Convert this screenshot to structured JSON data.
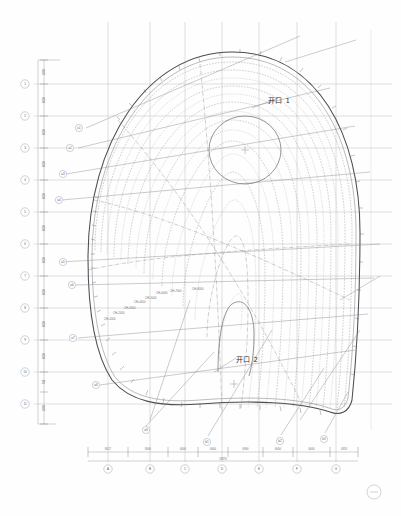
{
  "drawing": {
    "title": "屋面壳体平面图",
    "type": "architectural-shell-roof-plan",
    "sheet_marker": "page-marker-circle",
    "background_color": "#fefefe",
    "line_color": "#4c4c52",
    "grid_color": "#b9b9bd",
    "contour_color": "#8e8e96"
  },
  "openings": [
    {
      "id": "opening-1",
      "label": "开口 1",
      "label_x": 268,
      "label_y": 101,
      "cx": 245,
      "cy": 150,
      "rx": 36,
      "ry": 34,
      "center_mark": true
    },
    {
      "id": "opening-2",
      "label": "开口 2",
      "label_y": 360,
      "label_x": 236,
      "label_x2": 236
    }
  ],
  "contour_labels": [
    {
      "text": "CH+1000",
      "x": 104,
      "y": 320
    },
    {
      "text": "CH+2000",
      "x": 113,
      "y": 314
    },
    {
      "text": "CH+3000",
      "x": 124,
      "y": 309
    },
    {
      "text": "CH+4000",
      "x": 134,
      "y": 303
    },
    {
      "text": "CH+5000",
      "x": 145,
      "y": 299
    },
    {
      "text": "CH+6000",
      "x": 156,
      "y": 294
    },
    {
      "text": "CH+7000",
      "x": 170,
      "y": 292
    },
    {
      "text": "CH+8000",
      "x": 192,
      "y": 290
    }
  ],
  "dimensions": {
    "bottom": {
      "total_label": "53870",
      "segments": [
        {
          "label": "8017",
          "x1": 88,
          "x2": 128
        },
        {
          "label": "8000",
          "x1": 128,
          "x2": 168
        },
        {
          "label": "6000",
          "x1": 168,
          "x2": 198
        },
        {
          "label": "6000",
          "x1": 198,
          "x2": 228
        },
        {
          "label": "6990",
          "x1": 228,
          "x2": 263
        },
        {
          "label": "6000",
          "x1": 263,
          "x2": 293
        },
        {
          "label": "6000",
          "x1": 293,
          "x2": 330
        },
        {
          "label": "4953",
          "x1": 330,
          "x2": 358
        }
      ]
    },
    "left": {
      "segments": [
        {
          "label": "5000",
          "y1": 60,
          "y2": 84
        },
        {
          "label": "6000",
          "y1": 84,
          "y2": 116
        },
        {
          "label": "6000",
          "y1": 116,
          "y2": 148
        },
        {
          "label": "6000",
          "y1": 148,
          "y2": 180
        },
        {
          "label": "6000",
          "y1": 180,
          "y2": 212
        },
        {
          "label": "6000",
          "y1": 212,
          "y2": 244
        },
        {
          "label": "6000",
          "y1": 244,
          "y2": 276
        },
        {
          "label": "6000",
          "y1": 276,
          "y2": 308
        },
        {
          "label": "6000",
          "y1": 308,
          "y2": 340
        },
        {
          "label": "6000",
          "y1": 340,
          "y2": 372
        },
        {
          "label": "700",
          "y1": 372,
          "y2": 392
        },
        {
          "label": "5000",
          "y1": 392,
          "y2": 424
        }
      ]
    }
  },
  "grid_bubbles": {
    "bottom": [
      {
        "label": "A",
        "x": 108,
        "y": 469
      },
      {
        "label": "B",
        "x": 150,
        "y": 469
      },
      {
        "label": "C",
        "x": 185,
        "y": 469
      },
      {
        "label": "D",
        "x": 222,
        "y": 469
      },
      {
        "label": "E",
        "x": 259,
        "y": 469
      },
      {
        "label": "F",
        "x": 297,
        "y": 469
      },
      {
        "label": "G",
        "x": 336,
        "y": 469
      }
    ],
    "left": [
      {
        "label": "1",
        "x": 25,
        "y": 84
      },
      {
        "label": "2",
        "x": 25,
        "y": 116
      },
      {
        "label": "3",
        "x": 25,
        "y": 148
      },
      {
        "label": "4",
        "x": 25,
        "y": 180
      },
      {
        "label": "5",
        "x": 25,
        "y": 212
      },
      {
        "label": "6",
        "x": 25,
        "y": 244
      },
      {
        "label": "7",
        "x": 25,
        "y": 276
      },
      {
        "label": "8",
        "x": 25,
        "y": 308
      },
      {
        "label": "9",
        "x": 25,
        "y": 340
      },
      {
        "label": "10",
        "x": 25,
        "y": 372
      },
      {
        "label": "11",
        "x": 25,
        "y": 404
      }
    ]
  },
  "callout_bubbles": [
    {
      "label": "a1",
      "x": 79,
      "y": 128,
      "tx": 175,
      "ty": 110
    },
    {
      "label": "a2",
      "x": 70,
      "y": 148,
      "tx": 160,
      "ty": 132
    },
    {
      "label": "a3",
      "x": 63,
      "y": 174,
      "tx": 150,
      "ty": 160
    },
    {
      "label": "a4",
      "x": 59,
      "y": 200,
      "tx": 146,
      "ty": 188
    },
    {
      "label": "a5",
      "x": 63,
      "y": 262,
      "tx": 150,
      "ty": 252
    },
    {
      "label": "a6",
      "x": 72,
      "y": 285,
      "tx": 160,
      "ty": 276
    },
    {
      "label": "a7",
      "x": 73,
      "y": 338,
      "tx": 162,
      "ty": 330
    },
    {
      "label": "a8",
      "x": 96,
      "y": 385,
      "tx": 178,
      "ty": 372
    },
    {
      "label": "a9",
      "x": 146,
      "y": 430,
      "tx": 206,
      "ty": 392
    },
    {
      "label": "b1",
      "x": 207,
      "y": 442,
      "tx": 252,
      "ty": 400
    },
    {
      "label": "b2",
      "x": 280,
      "y": 441,
      "tx": 316,
      "ty": 398
    },
    {
      "label": "b3",
      "x": 324,
      "y": 439,
      "tx": 344,
      "ty": 404
    }
  ]
}
